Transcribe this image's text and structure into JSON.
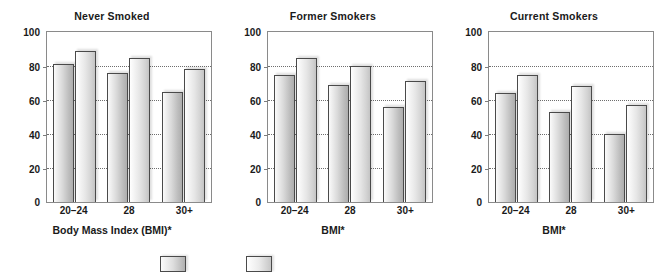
{
  "chart_data": {
    "type": "bar",
    "title": "",
    "categories": [
      "20–24",
      "28",
      "30+"
    ],
    "ylim": [
      0,
      100
    ],
    "yticks": [
      0,
      20,
      40,
      60,
      80,
      100
    ],
    "ytick_labels": [
      "0",
      "20",
      "40",
      "60",
      "80",
      "100"
    ],
    "gridlines": [
      20,
      40,
      60,
      80
    ],
    "grid": true,
    "legend": "none",
    "legend_position": "bottom",
    "panels": [
      {
        "title": "Never Smoked",
        "xlabel": "Body Mass Index (BMI)*",
        "categories": [
          "20–24",
          "28",
          "30+"
        ],
        "series": [
          {
            "name": "series-1",
            "values": [
              81,
              76,
              65
            ]
          },
          {
            "name": "series-2",
            "values": [
              89,
              85,
              78
            ]
          }
        ]
      },
      {
        "title": "Former Smokers",
        "xlabel": "BMI*",
        "categories": [
          "20–24",
          "28",
          "30+"
        ],
        "series": [
          {
            "name": "series-1",
            "values": [
              75,
              69,
              56
            ]
          },
          {
            "name": "series-2",
            "values": [
              85,
              80,
              71
            ]
          }
        ]
      },
      {
        "title": "Current Smokers",
        "xlabel": "BMI*",
        "categories": [
          "20–24",
          "28",
          "30+"
        ],
        "series": [
          {
            "name": "series-1",
            "values": [
              64,
              53,
              40
            ]
          },
          {
            "name": "series-2",
            "values": [
              75,
              68,
              57
            ]
          }
        ]
      }
    ]
  },
  "colors": {
    "axis": "#8a8a8a",
    "grid": "#6e6e6e",
    "bar_outline": "#4a4a4a",
    "text": "#1a1a1a"
  }
}
